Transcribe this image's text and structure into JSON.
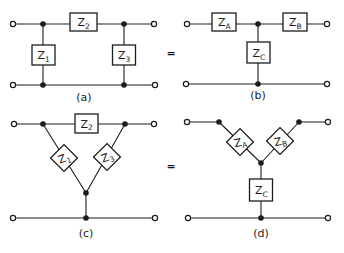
{
  "colors": {
    "ink": "#1c1c1c",
    "background": "#ffffff"
  },
  "equals": "=",
  "circuits": {
    "a": {
      "caption": "(a)",
      "labels": {
        "z1": {
          "base": "Z",
          "sub": "1"
        },
        "z2": {
          "base": "Z",
          "sub": "2"
        },
        "z3": {
          "base": "Z",
          "sub": "3"
        }
      }
    },
    "b": {
      "caption": "(b)",
      "labels": {
        "za": {
          "base": "Z",
          "sub": "A"
        },
        "zb": {
          "base": "Z",
          "sub": "B"
        },
        "zc": {
          "base": "Z",
          "sub": "C"
        }
      }
    },
    "c": {
      "caption": "(c)",
      "labels": {
        "z1": {
          "base": "Z",
          "sub": "1"
        },
        "z2": {
          "base": "Z",
          "sub": "2"
        },
        "z3": {
          "base": "Z",
          "sub": "3"
        }
      }
    },
    "d": {
      "caption": "(d)",
      "labels": {
        "za": {
          "base": "Z",
          "sub": "A"
        },
        "zb": {
          "base": "Z",
          "sub": "B"
        },
        "zc": {
          "base": "Z",
          "sub": "C"
        }
      }
    }
  }
}
